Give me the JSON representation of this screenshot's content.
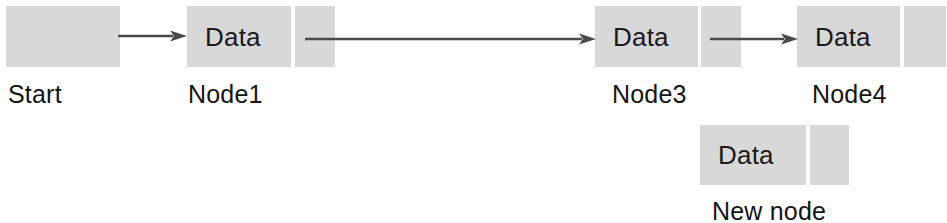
{
  "diagram": {
    "type": "singly-linked-list-insertion",
    "fill_color": "#d8d8d8",
    "stroke_color": "#4a4a4a",
    "text_color": "#141414",
    "cell_data_text": "Data",
    "nodes": [
      {
        "id": "start",
        "caption": "Start",
        "has_data_cell": false,
        "has_pointer_cell": true,
        "x": 6,
        "y": 6,
        "data_w": 0,
        "ptr_w": 114,
        "h": 61,
        "caption_x": 8,
        "caption_y": 82
      },
      {
        "id": "node1",
        "caption": "Node1",
        "has_data_cell": true,
        "has_pointer_cell": true,
        "x": 187,
        "y": 6,
        "data_w": 104,
        "ptr_w": 40,
        "h": 61,
        "gap": 4,
        "caption_x": 188,
        "caption_y": 82
      },
      {
        "id": "node3",
        "caption": "Node3",
        "has_data_cell": true,
        "has_pointer_cell": true,
        "x": 595,
        "y": 6,
        "data_w": 103,
        "ptr_w": 40,
        "h": 61,
        "gap": 3,
        "caption_x": 612,
        "caption_y": 82
      },
      {
        "id": "node4",
        "caption": "Node4",
        "has_data_cell": true,
        "has_pointer_cell": true,
        "x": 797,
        "y": 6,
        "data_w": 103,
        "ptr_w": 42,
        "h": 61,
        "gap": 4,
        "caption_x": 812,
        "caption_y": 82
      },
      {
        "id": "new-node",
        "caption": "New node",
        "has_data_cell": true,
        "has_pointer_cell": true,
        "x": 700,
        "y": 125,
        "data_w": 106,
        "ptr_w": 39,
        "h": 60,
        "gap": 4,
        "caption_x": 712,
        "caption_y": 199
      }
    ],
    "arrows": [
      {
        "id": "start-to-node1",
        "from": "start",
        "to": "node1",
        "x": 118,
        "y": 26,
        "length": 69
      },
      {
        "id": "node1-to-node3",
        "from": "node1",
        "to": "node3",
        "x": 305,
        "y": 29,
        "length": 291
      },
      {
        "id": "node3-to-node4",
        "from": "node3",
        "to": "node4",
        "x": 710,
        "y": 29,
        "length": 88
      }
    ]
  }
}
